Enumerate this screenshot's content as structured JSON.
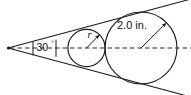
{
  "figure": {
    "background_color": "#ffffff",
    "stroke_color": "#1a1a1a",
    "dash_color": "#2b2b2b",
    "width": 191,
    "height": 95
  },
  "labels": {
    "angle_value": "30",
    "angle_degree_symbol": "°",
    "small_radius": "r",
    "large_radius": "2.0 in."
  },
  "geometry": {
    "apex": {
      "x": 8,
      "y": 48
    },
    "half_angle_degrees": 15,
    "full_angle_degrees": 30,
    "axis": {
      "x1": 10,
      "y1": 48,
      "x2": 191,
      "y2": 48,
      "style": "dashed"
    },
    "small_circle": {
      "cx": 86.5,
      "cy": 48,
      "r": 18.6
    },
    "large_circle": {
      "cx": 141,
      "cy": 48,
      "r": 36.0
    },
    "small_radius_arrow": {
      "x1": 86.5,
      "y1": 48,
      "x2": 99.5,
      "y2": 34.7
    },
    "large_radius_arrow": {
      "x1": 141,
      "y1": 48,
      "x2": 166.5,
      "y2": 22.6
    },
    "angle_ticks": [
      {
        "x": 33,
        "y_top": 41.5,
        "y_bottom": 55
      },
      {
        "x": 56,
        "y_top": 40,
        "y_bottom": 56.5
      }
    ],
    "tangent_upper": {
      "x1": 8,
      "y1": 48,
      "x2": 191,
      "y2": -1
    },
    "tangent_lower": {
      "x1": 8,
      "y1": 48,
      "x2": 191,
      "y2": 97
    }
  }
}
